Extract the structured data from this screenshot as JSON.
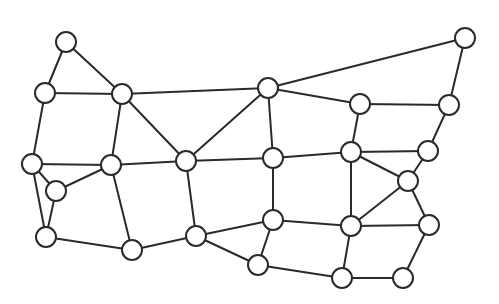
{
  "diagram": {
    "type": "planar-graph",
    "colors": {
      "stroke": "#2a2a2a",
      "node_fill": "#ffffff",
      "background": "#ffffff"
    },
    "node_radius": 10,
    "nodes": [
      {
        "id": "A",
        "x": 66,
        "y": 42
      },
      {
        "id": "B",
        "x": 45,
        "y": 93
      },
      {
        "id": "C",
        "x": 122,
        "y": 94
      },
      {
        "id": "D",
        "x": 32,
        "y": 164
      },
      {
        "id": "E",
        "x": 56,
        "y": 191
      },
      {
        "id": "F",
        "x": 111,
        "y": 165
      },
      {
        "id": "G",
        "x": 46,
        "y": 237
      },
      {
        "id": "H",
        "x": 132,
        "y": 250
      },
      {
        "id": "I",
        "x": 268,
        "y": 88
      },
      {
        "id": "J",
        "x": 186,
        "y": 161
      },
      {
        "id": "K",
        "x": 273,
        "y": 158
      },
      {
        "id": "L",
        "x": 196,
        "y": 236
      },
      {
        "id": "M",
        "x": 273,
        "y": 220
      },
      {
        "id": "N",
        "x": 258,
        "y": 265
      },
      {
        "id": "O",
        "x": 360,
        "y": 104
      },
      {
        "id": "P",
        "x": 449,
        "y": 105
      },
      {
        "id": "Q",
        "x": 351,
        "y": 152
      },
      {
        "id": "R",
        "x": 428,
        "y": 151
      },
      {
        "id": "S",
        "x": 408,
        "y": 181
      },
      {
        "id": "T",
        "x": 351,
        "y": 226
      },
      {
        "id": "U",
        "x": 429,
        "y": 225
      },
      {
        "id": "W",
        "x": 342,
        "y": 278
      },
      {
        "id": "X",
        "x": 403,
        "y": 278
      },
      {
        "id": "Z",
        "x": 465,
        "y": 38
      }
    ],
    "edges": [
      [
        "A",
        "B"
      ],
      [
        "A",
        "C"
      ],
      [
        "B",
        "C"
      ],
      [
        "B",
        "D"
      ],
      [
        "C",
        "I"
      ],
      [
        "C",
        "J"
      ],
      [
        "C",
        "F"
      ],
      [
        "I",
        "Z"
      ],
      [
        "I",
        "J"
      ],
      [
        "I",
        "K"
      ],
      [
        "I",
        "O"
      ],
      [
        "Z",
        "P"
      ],
      [
        "P",
        "O"
      ],
      [
        "P",
        "R"
      ],
      [
        "O",
        "Q"
      ],
      [
        "D",
        "F"
      ],
      [
        "D",
        "E"
      ],
      [
        "D",
        "G"
      ],
      [
        "E",
        "F"
      ],
      [
        "E",
        "G"
      ],
      [
        "F",
        "J"
      ],
      [
        "F",
        "H"
      ],
      [
        "G",
        "H"
      ],
      [
        "H",
        "L"
      ],
      [
        "J",
        "K"
      ],
      [
        "J",
        "L"
      ],
      [
        "K",
        "Q"
      ],
      [
        "K",
        "M"
      ],
      [
        "Q",
        "R"
      ],
      [
        "Q",
        "S"
      ],
      [
        "Q",
        "T"
      ],
      [
        "R",
        "S"
      ],
      [
        "S",
        "T"
      ],
      [
        "S",
        "U"
      ],
      [
        "M",
        "L"
      ],
      [
        "M",
        "T"
      ],
      [
        "M",
        "N"
      ],
      [
        "L",
        "N"
      ],
      [
        "N",
        "W"
      ],
      [
        "T",
        "W"
      ],
      [
        "T",
        "U"
      ],
      [
        "U",
        "X"
      ],
      [
        "W",
        "X"
      ]
    ]
  }
}
